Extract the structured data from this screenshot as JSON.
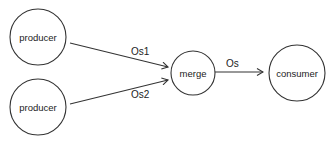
{
  "diagram": {
    "type": "dataflow",
    "nodes": [
      {
        "id": "producer1",
        "label": "producer"
      },
      {
        "id": "producer2",
        "label": "producer"
      },
      {
        "id": "merge",
        "label": "merge"
      },
      {
        "id": "consumer",
        "label": "consumer"
      }
    ],
    "edges": [
      {
        "from": "producer1",
        "to": "merge",
        "label": "Os1"
      },
      {
        "from": "producer2",
        "to": "merge",
        "label": "Os2"
      },
      {
        "from": "merge",
        "to": "consumer",
        "label": "Os"
      }
    ],
    "colors": {
      "stroke": "#333333",
      "background": "#ffffff",
      "text": "#222222"
    }
  }
}
